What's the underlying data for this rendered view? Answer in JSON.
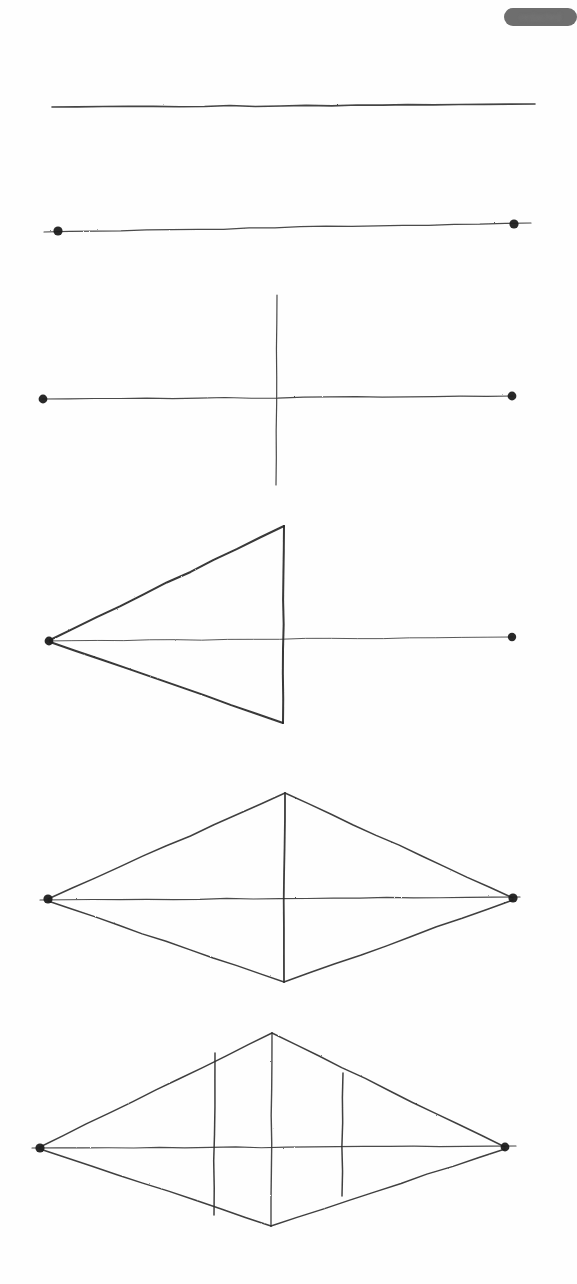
{
  "page": {
    "width": 577,
    "height": 1284,
    "background_color": "#fefefe",
    "ink_color": "#2b2b2b",
    "medium": "pencil-on-paper-scan"
  },
  "badge": {
    "name": "redacted-label",
    "text": "redacted",
    "fill_color": "#6e6e6e",
    "text_color": "#7b7b7b",
    "x": 504,
    "y": 8,
    "width": 73,
    "height": 18,
    "corner_radius": 9,
    "blurred": true
  },
  "figures": [
    {
      "id": "step-1",
      "name": "plain-segment",
      "caption": "Step 1 — a single freehand straight segment",
      "elements": [
        {
          "kind": "line",
          "name": "baseline",
          "x1": 52,
          "y1": 107,
          "x2": 535,
          "y2": 104,
          "weight": 1.6,
          "tone": "#333333"
        }
      ],
      "points": []
    },
    {
      "id": "step-2",
      "name": "segment-with-endpoints",
      "caption": "Step 2 — the segment with its two endpoints marked",
      "elements": [
        {
          "kind": "line",
          "name": "baseline",
          "x1": 44,
          "y1": 232,
          "x2": 531,
          "y2": 223,
          "weight": 1.2,
          "tone": "#3a3a3a"
        }
      ],
      "points": [
        {
          "name": "left-endpoint-dot",
          "cx": 58,
          "cy": 231,
          "r": 4.6
        },
        {
          "name": "right-endpoint-dot",
          "cx": 514,
          "cy": 224,
          "r": 4.6
        }
      ]
    },
    {
      "id": "step-3",
      "name": "perpendicular-bisector",
      "caption": "Step 3 — a vertical perpendicular crossing the segment at its midpoint",
      "elements": [
        {
          "kind": "line",
          "name": "baseline",
          "x1": 42,
          "y1": 399,
          "x2": 513,
          "y2": 396,
          "weight": 1.2,
          "tone": "#3a3a3a"
        },
        {
          "kind": "line",
          "name": "perpendicular-axis",
          "x1": 277,
          "y1": 295,
          "x2": 276,
          "y2": 485,
          "weight": 1.2,
          "tone": "#3a3a3a"
        }
      ],
      "points": [
        {
          "name": "left-endpoint-dot",
          "cx": 43,
          "cy": 399,
          "r": 4.4
        },
        {
          "name": "right-endpoint-dot",
          "cx": 512,
          "cy": 396,
          "r": 4.4
        }
      ]
    },
    {
      "id": "step-4",
      "name": "left-triangle",
      "caption": "Step 4 — triangle joining the left endpoint to both ends of the perpendicular",
      "elements": [
        {
          "kind": "line",
          "name": "baseline",
          "x1": 46,
          "y1": 641,
          "x2": 513,
          "y2": 637,
          "weight": 1.0,
          "tone": "#4a4a4a"
        },
        {
          "kind": "line",
          "name": "chord-vertical",
          "x1": 284,
          "y1": 526,
          "x2": 283,
          "y2": 723,
          "weight": 2.0,
          "tone": "#262626"
        },
        {
          "kind": "line",
          "name": "triangle-upper-edge",
          "x1": 50,
          "y1": 640,
          "x2": 284,
          "y2": 526,
          "weight": 2.0,
          "tone": "#262626"
        },
        {
          "kind": "line",
          "name": "triangle-lower-edge",
          "x1": 50,
          "y1": 642,
          "x2": 283,
          "y2": 723,
          "weight": 2.0,
          "tone": "#262626"
        }
      ],
      "points": [
        {
          "name": "left-apex-dot",
          "cx": 49,
          "cy": 641,
          "r": 4.4
        },
        {
          "name": "right-endpoint-dot",
          "cx": 512,
          "cy": 637,
          "r": 4.2
        }
      ]
    },
    {
      "id": "step-5",
      "name": "rhombus",
      "caption": "Step 5 — both endpoints joined to the perpendicular, forming a rhombus",
      "elements": [
        {
          "kind": "line",
          "name": "horizontal-diagonal",
          "x1": 40,
          "y1": 900,
          "x2": 520,
          "y2": 897,
          "weight": 1.2,
          "tone": "#3a3a3a"
        },
        {
          "kind": "line",
          "name": "vertical-diagonal",
          "x1": 285,
          "y1": 793,
          "x2": 284,
          "y2": 982,
          "weight": 1.8,
          "tone": "#2b2b2b"
        },
        {
          "kind": "line",
          "name": "edge-top-left",
          "x1": 48,
          "y1": 899,
          "x2": 285,
          "y2": 793,
          "weight": 1.5,
          "tone": "#2f2f2f"
        },
        {
          "kind": "line",
          "name": "edge-top-right",
          "x1": 285,
          "y1": 793,
          "x2": 513,
          "y2": 898,
          "weight": 1.5,
          "tone": "#2f2f2f"
        },
        {
          "kind": "line",
          "name": "edge-bottom-left",
          "x1": 48,
          "y1": 901,
          "x2": 284,
          "y2": 982,
          "weight": 1.5,
          "tone": "#2f2f2f"
        },
        {
          "kind": "line",
          "name": "edge-bottom-right",
          "x1": 284,
          "y1": 982,
          "x2": 513,
          "y2": 900,
          "weight": 1.5,
          "tone": "#2f2f2f"
        }
      ],
      "points": [
        {
          "name": "left-vertex-dot",
          "cx": 48,
          "cy": 899,
          "r": 4.6
        },
        {
          "name": "right-vertex-dot",
          "cx": 513,
          "cy": 898,
          "r": 4.6
        }
      ]
    },
    {
      "id": "step-6",
      "name": "rhombus-with-chords",
      "caption": "Step 6 — the rhombus with two extra vertical chords flanking the axis",
      "elements": [
        {
          "kind": "line",
          "name": "horizontal-diagonal",
          "x1": 32,
          "y1": 1148,
          "x2": 516,
          "y2": 1146,
          "weight": 1.2,
          "tone": "#3a3a3a"
        },
        {
          "kind": "line",
          "name": "vertical-diagonal",
          "x1": 272,
          "y1": 1033,
          "x2": 271,
          "y2": 1226,
          "weight": 1.4,
          "tone": "#3a3a3a"
        },
        {
          "kind": "line",
          "name": "edge-top-left",
          "x1": 40,
          "y1": 1147,
          "x2": 272,
          "y2": 1033,
          "weight": 1.5,
          "tone": "#2f2f2f"
        },
        {
          "kind": "line",
          "name": "edge-top-right",
          "x1": 272,
          "y1": 1033,
          "x2": 505,
          "y2": 1147,
          "weight": 1.5,
          "tone": "#2f2f2f"
        },
        {
          "kind": "line",
          "name": "edge-bottom-left",
          "x1": 40,
          "y1": 1149,
          "x2": 271,
          "y2": 1226,
          "weight": 1.5,
          "tone": "#2f2f2f"
        },
        {
          "kind": "line",
          "name": "edge-bottom-right",
          "x1": 271,
          "y1": 1226,
          "x2": 505,
          "y2": 1149,
          "weight": 1.5,
          "tone": "#2f2f2f"
        },
        {
          "kind": "line",
          "name": "chord-left-vertical",
          "x1": 215,
          "y1": 1053,
          "x2": 214,
          "y2": 1215,
          "weight": 1.5,
          "tone": "#2f2f2f"
        },
        {
          "kind": "line",
          "name": "chord-right-vertical",
          "x1": 343,
          "y1": 1073,
          "x2": 342,
          "y2": 1196,
          "weight": 1.5,
          "tone": "#2f2f2f"
        }
      ],
      "points": [
        {
          "name": "left-vertex-dot",
          "cx": 40,
          "cy": 1148,
          "r": 4.6
        },
        {
          "name": "right-vertex-dot",
          "cx": 505,
          "cy": 1147,
          "r": 4.4
        }
      ]
    }
  ]
}
